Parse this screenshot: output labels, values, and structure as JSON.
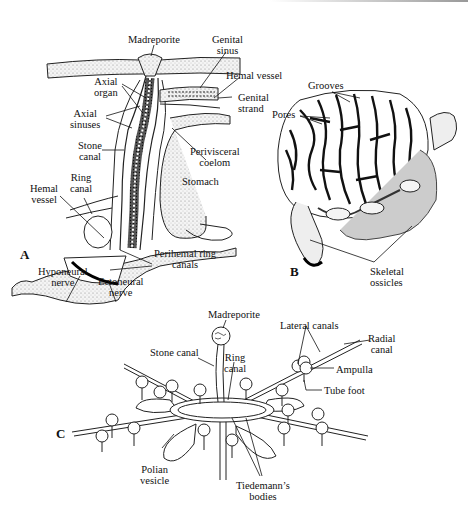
{
  "figure": {
    "panels": [
      {
        "id": "A",
        "letter": "A",
        "labels": {
          "madreporite": "Madreporite",
          "genital_sinus": [
            "Genital",
            "sinus"
          ],
          "hemal_vessel_top": "Hemal vessel",
          "genital_strand": [
            "Genital",
            "strand"
          ],
          "axial_organ": [
            "Axial",
            "organ"
          ],
          "axial_sinuses": [
            "Axial",
            "sinuses"
          ],
          "stone_canal": [
            "Stone",
            "canal"
          ],
          "perivisceral_coelom": [
            "Perivisceral",
            "coelom"
          ],
          "stomach": "Stomach",
          "ring_canal": [
            "Ring",
            "canal"
          ],
          "hemal_vessel_left": [
            "Hemal",
            "vessel"
          ],
          "perihemal_ring_canals": [
            "Perihemal ring",
            "canals"
          ],
          "hyponeural_nerve": [
            "Hyponeural",
            "nerve"
          ],
          "ectoneural_nerve": [
            "Ectoneural",
            "nerve"
          ]
        }
      },
      {
        "id": "B",
        "letter": "B",
        "labels": {
          "grooves": "Grooves",
          "pores": "Pores",
          "skeletal_ossicles": [
            "Skeletal",
            "ossicles"
          ]
        }
      },
      {
        "id": "C",
        "letter": "C",
        "labels": {
          "madreporite": "Madreporite",
          "stone_canal": "Stone canal",
          "ring_canal": [
            "Ring",
            "canal"
          ],
          "lateral_canals": "Lateral canals",
          "radial_canal": [
            "Radial",
            "canal"
          ],
          "ampulla": "Ampulla",
          "tube_foot": "Tube foot",
          "polian_vesicle": [
            "Polian",
            "vesicle"
          ],
          "tiedemanns_bodies": [
            "Tiedemann’s",
            "bodies"
          ]
        }
      }
    ]
  }
}
